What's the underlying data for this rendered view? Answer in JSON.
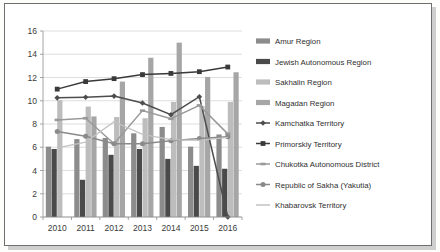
{
  "chart_data": {
    "type": "bar",
    "title": "",
    "xlabel": "",
    "ylabel": "",
    "categories": [
      "2010",
      "2011",
      "2012",
      "2013",
      "2014",
      "2015",
      "2016"
    ],
    "ylim": [
      0,
      16
    ],
    "ytick_labels": [
      "0",
      "2",
      "4",
      "6",
      "8",
      "10",
      "12",
      "14",
      "16"
    ],
    "ytick_values": [
      0,
      2,
      4,
      6,
      8,
      10,
      12,
      14,
      16
    ],
    "grid": true,
    "legend_position": "right",
    "bar_series": [
      {
        "name": "Amur Region",
        "marker": "bar",
        "color": "#8c8c8c",
        "values": [
          6.05,
          6.7,
          6.8,
          7.2,
          7.75,
          6.05,
          7.1
        ]
      },
      {
        "name": "Jewish Autonomous Region",
        "marker": "bar",
        "color": "#4a4a4a",
        "values": [
          5.85,
          3.2,
          5.35,
          5.85,
          5.0,
          4.4,
          4.15
        ]
      },
      {
        "name": "Sakhalin Region",
        "marker": "bar",
        "color": "#bdbdbd",
        "values": [
          10.05,
          9.5,
          8.6,
          8.5,
          9.9,
          9.55,
          9.9
        ]
      },
      {
        "name": "Magadan Region",
        "marker": "bar",
        "color": "#a6a6a6",
        "values": [
          null,
          8.65,
          11.65,
          13.7,
          15.0,
          12.05,
          12.45
        ]
      }
    ],
    "line_series": [
      {
        "name": "Kamchatka Territory",
        "marker": "diamond",
        "color": "#4d4d4d",
        "values": [
          10.25,
          10.3,
          10.4,
          9.8,
          8.8,
          10.35,
          0.0
        ]
      },
      {
        "name": "Primorskiy Territory",
        "marker": "square",
        "color": "#3a3a3a",
        "values": [
          11.0,
          11.65,
          11.9,
          12.25,
          12.35,
          12.5,
          12.9
        ]
      },
      {
        "name": "Chukotka Autonomous District",
        "marker": "dash",
        "color": "#9a9a9a",
        "values": [
          8.35,
          8.5,
          6.3,
          9.15,
          8.45,
          9.6,
          7.15
        ]
      },
      {
        "name": "Republic of Sakha (Yakutia)",
        "marker": "circle",
        "color": "#8a8a8a",
        "values": [
          7.35,
          6.95,
          6.3,
          6.3,
          6.55,
          6.75,
          6.9
        ]
      },
      {
        "name": "Khabarovsk Territory",
        "marker": "line",
        "color": "#c2c2c2",
        "values": [
          5.95,
          6.45,
          8.2,
          7.1,
          6.65,
          6.6,
          6.85
        ]
      }
    ]
  },
  "legend": {
    "items": [
      {
        "label": "Amur Region",
        "type": "bar",
        "color": "#8c8c8c"
      },
      {
        "label": "Jewish Autonomous Region",
        "type": "bar",
        "color": "#4a4a4a"
      },
      {
        "label": "Sakhalin Region",
        "type": "bar",
        "color": "#bdbdbd"
      },
      {
        "label": "Magadan Region",
        "type": "bar",
        "color": "#a6a6a6"
      },
      {
        "label": "Kamchatka Territory",
        "type": "line-diamond",
        "color": "#4d4d4d"
      },
      {
        "label": "Primorskiy Territory",
        "type": "line-square",
        "color": "#3a3a3a"
      },
      {
        "label": "Chukotka Autonomous District",
        "type": "line-dash",
        "color": "#9a9a9a"
      },
      {
        "label": "Republic of Sakha (Yakutia)",
        "type": "line-circle",
        "color": "#8a8a8a"
      },
      {
        "label": "Khabarovsk Territory",
        "type": "line-plain",
        "color": "#c2c2c2"
      }
    ]
  }
}
